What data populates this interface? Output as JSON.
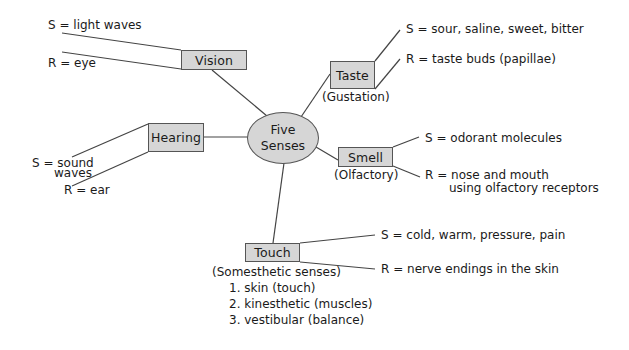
{
  "center": {
    "line1": "Five",
    "line2": "Senses"
  },
  "vision": {
    "label": "Vision",
    "stimulus": "S = light waves",
    "receptor": "R = eye"
  },
  "taste": {
    "label": "Taste",
    "subtitle": "(Gustation)",
    "stimulus": "S = sour, saline, sweet, bitter",
    "receptor": "R = taste buds (papillae)"
  },
  "hearing": {
    "label": "Hearing",
    "stimulus_line1": "S = sound",
    "stimulus_line2": "waves",
    "receptor": "R = ear"
  },
  "smell": {
    "label": "Smell",
    "subtitle": "(Olfactory)",
    "stimulus": "S = odorant molecules",
    "receptor_line1": "R = nose and mouth",
    "receptor_line2": "using olfactory receptors"
  },
  "touch": {
    "label": "Touch",
    "subtitle": "(Somesthetic senses)",
    "stimulus": "S = cold, warm, pressure, pain",
    "receptor": "R = nerve endings in the skin",
    "subtypes": [
      "1. skin (touch)",
      "2. kinesthetic (muscles)",
      "3. vestibular (balance)"
    ]
  },
  "colors": {
    "node_fill": "#d6d6d6",
    "node_border": "#555555",
    "line": "#444444"
  }
}
